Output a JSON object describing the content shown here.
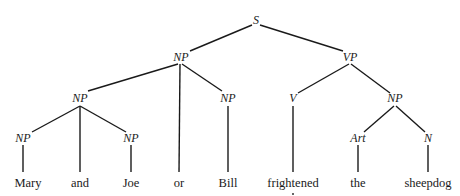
{
  "diagram": {
    "type": "syntax-tree",
    "colors": {
      "line": "#1a1a1a",
      "text": "#1a1a1a",
      "background": "#ffffff"
    },
    "nodes": {
      "s": {
        "label": "S",
        "x": 256,
        "y": 24
      },
      "np_subj": {
        "label": "NP",
        "x": 181,
        "y": 61
      },
      "vp": {
        "label": "VP",
        "x": 350,
        "y": 61
      },
      "np_coord": {
        "label": "NP",
        "x": 80,
        "y": 102
      },
      "np_bill": {
        "label": "NP",
        "x": 228,
        "y": 102
      },
      "v": {
        "label": "V",
        "x": 293,
        "y": 102
      },
      "np_obj": {
        "label": "NP",
        "x": 395,
        "y": 102
      },
      "np_mary": {
        "label": "NP",
        "x": 23,
        "y": 142
      },
      "np_joe": {
        "label": "NP",
        "x": 131,
        "y": 142
      },
      "art": {
        "label": "Art",
        "x": 358,
        "y": 142
      },
      "n": {
        "label": "N",
        "x": 428,
        "y": 142
      }
    },
    "words": [
      {
        "text": "Mary",
        "x": 28,
        "y": 187
      },
      {
        "text": "and",
        "x": 80,
        "y": 187
      },
      {
        "text": "Joe",
        "x": 131,
        "y": 187
      },
      {
        "text": "or",
        "x": 179,
        "y": 187
      },
      {
        "text": "Bill",
        "x": 228,
        "y": 187
      },
      {
        "text": "frightened",
        "x": 293,
        "y": 187
      },
      {
        "text": "the",
        "x": 358,
        "y": 187
      },
      {
        "text": "sheepdog",
        "x": 428,
        "y": 187
      }
    ],
    "edges": [
      {
        "x1": 252,
        "y1": 25,
        "x2": 190,
        "y2": 51
      },
      {
        "x1": 260,
        "y1": 25,
        "x2": 343,
        "y2": 51
      },
      {
        "x1": 178,
        "y1": 64,
        "x2": 88,
        "y2": 91
      },
      {
        "x1": 180,
        "y1": 64,
        "x2": 179,
        "y2": 172
      },
      {
        "x1": 182,
        "y1": 64,
        "x2": 222,
        "y2": 91
      },
      {
        "x1": 349,
        "y1": 64,
        "x2": 298,
        "y2": 93
      },
      {
        "x1": 351,
        "y1": 64,
        "x2": 390,
        "y2": 93
      },
      {
        "x1": 80,
        "y1": 106,
        "x2": 32,
        "y2": 132
      },
      {
        "x1": 80,
        "y1": 106,
        "x2": 80,
        "y2": 172
      },
      {
        "x1": 80,
        "y1": 106,
        "x2": 126,
        "y2": 132
      },
      {
        "x1": 228,
        "y1": 106,
        "x2": 228,
        "y2": 172
      },
      {
        "x1": 293,
        "y1": 106,
        "x2": 293,
        "y2": 172
      },
      {
        "x1": 394,
        "y1": 106,
        "x2": 364,
        "y2": 132
      },
      {
        "x1": 396,
        "y1": 106,
        "x2": 425,
        "y2": 132
      },
      {
        "x1": 23,
        "y1": 145,
        "x2": 23,
        "y2": 172
      },
      {
        "x1": 131,
        "y1": 145,
        "x2": 131,
        "y2": 172
      },
      {
        "x1": 358,
        "y1": 145,
        "x2": 358,
        "y2": 172
      },
      {
        "x1": 428,
        "y1": 145,
        "x2": 428,
        "y2": 172
      }
    ],
    "footnote_mark": {
      "symbol": "dot",
      "x": 293,
      "y": 194
    }
  }
}
